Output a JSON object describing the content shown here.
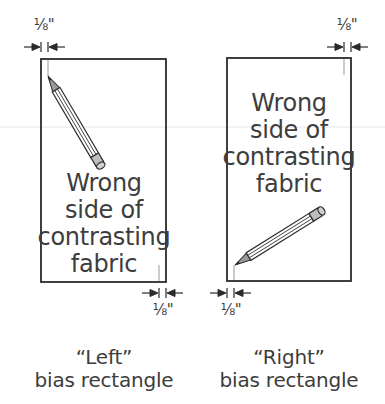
{
  "diagram": {
    "measurement_label": "⅛\"",
    "left_panel": {
      "fabric_label_lines": [
        "Wrong",
        "side of",
        "contrasting",
        "fabric"
      ],
      "top_measurement": "⅛\"",
      "bottom_measurement": "⅛\"",
      "caption_line1": "“Left”",
      "caption_line2": "bias rectangle"
    },
    "right_panel": {
      "fabric_label_lines": [
        "Wrong",
        "side of",
        "contrasting",
        "fabric"
      ],
      "top_measurement": "⅛\"",
      "bottom_measurement": "⅛\"",
      "caption_line1": "“Right”",
      "caption_line2": "bias rectangle"
    },
    "icons": {
      "pencil": "pencil-icon",
      "arrow": "dimension-arrow-icon"
    },
    "colors": {
      "line": "#2b2b2b",
      "text": "#3d3d3d",
      "pencil_fill": "#bdbdbd",
      "guide_line": "#9a9a9a"
    }
  }
}
